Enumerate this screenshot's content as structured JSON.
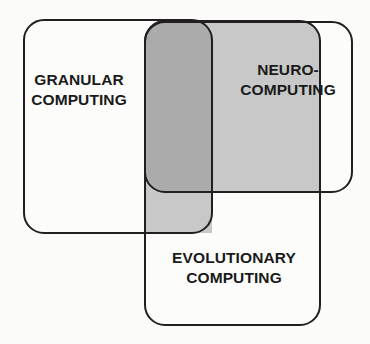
{
  "diagram": {
    "type": "venn-overlap",
    "background_color": "#fbfbfa",
    "stroke_color": "#231f20",
    "fill_white": "#fcfcfb",
    "fill_overlap_single": "#c8c8c8",
    "fill_overlap_triple": "#ababab",
    "sets": [
      {
        "id": "granular",
        "label": "GRANULAR\nCOMPUTING",
        "shape": "rounded-rectangle",
        "x": 24,
        "y": 20,
        "width": 188,
        "height": 213,
        "corner_radius": 20,
        "fill": "#fcfcfb"
      },
      {
        "id": "neuro",
        "label": "NEURO-\nCOMPUTING",
        "shape": "rounded-rectangle",
        "x": 145,
        "y": 22,
        "width": 207,
        "height": 170,
        "corner_radius": 20,
        "fill": "#fcfcfb"
      },
      {
        "id": "evolutionary",
        "label": "EVOLUTIONARY\nCOMPUTING",
        "shape": "rounded-rectangle",
        "x": 145,
        "y": 21,
        "width": 175,
        "height": 304,
        "corner_radius": 20,
        "fill": "#c8c8c8"
      }
    ],
    "regions": [
      {
        "id": "granular-evolutionary-overlap",
        "description": "vertical light gray band where granular and evolutionary overlap",
        "fill": "#c8c8c8"
      },
      {
        "id": "neuro-evolutionary-overlap",
        "description": "horizontal light gray band where neuro and evolutionary overlap",
        "fill": "#c8c8c8"
      },
      {
        "id": "triple-overlap",
        "description": "darker gray region where all three sets intersect",
        "fill": "#ababab"
      }
    ]
  }
}
